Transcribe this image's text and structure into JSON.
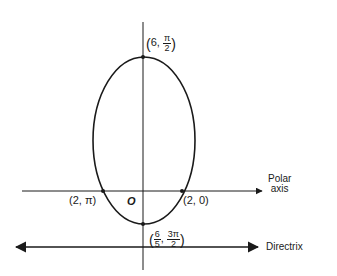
{
  "diagram": {
    "type": "polar-conic-ellipse",
    "stroke_color": "#1a1a1a",
    "curve": {
      "shape": "ellipse",
      "cx": 144,
      "cy": 140,
      "rx": 51,
      "ry": 84
    },
    "polar_axis": {
      "label_line1": "Polar",
      "label_line2": "axis"
    },
    "directrix": {
      "label": "Directrix"
    },
    "pole": {
      "label": "O"
    },
    "points": {
      "top": {
        "r": "6",
        "theta_num": "π",
        "theta_den": "2"
      },
      "left": {
        "label": "(2, π)"
      },
      "right": {
        "label": "(2, 0)"
      },
      "bottom": {
        "r_num": "6",
        "r_den": "5",
        "theta_num": "3π",
        "theta_den": "2"
      }
    }
  }
}
